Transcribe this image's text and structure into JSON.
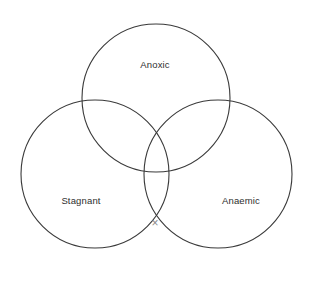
{
  "diagram": {
    "type": "venn-3-circle",
    "background_color": "#ffffff",
    "stroke_color": "#3a3a3a",
    "label_color": "#2e2e2e",
    "mark_color": "#8a8a8a",
    "title": "",
    "sets": [
      {
        "id": "anoxic",
        "label": "Anoxic",
        "position": "top",
        "center_x": 156,
        "center_y": 98,
        "radius": 74,
        "label_x": 155,
        "label_y": 65
      },
      {
        "id": "stagnant",
        "label": "Stagnant",
        "position": "bottom-left",
        "center_x": 95,
        "center_y": 174,
        "radius": 74,
        "label_x": 81,
        "label_y": 201
      },
      {
        "id": "anaemic",
        "label": "Anaemic",
        "position": "bottom-right",
        "center_x": 218,
        "center_y": 174,
        "radius": 74,
        "label_x": 241,
        "label_y": 201
      }
    ],
    "marks": [
      {
        "id": "histotoxic-cross",
        "glyph": "×",
        "x": 155,
        "y": 224,
        "region": "stagnant-anaemic-intersection"
      }
    ]
  }
}
